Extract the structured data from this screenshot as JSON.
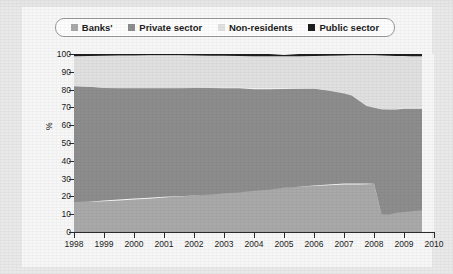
{
  "top_clipped_text": "· · · · · ·",
  "legend": {
    "items": [
      {
        "label": "Banks'",
        "color": "#a9a9a9",
        "icon": "square-swatch-icon"
      },
      {
        "label": "Private sector",
        "color": "#8d8d8d",
        "icon": "square-swatch-icon"
      },
      {
        "label": "Non-residents",
        "color": "#e0e0e0",
        "icon": "square-swatch-icon"
      },
      {
        "label": "Public sector",
        "color": "#1f1f1f",
        "icon": "square-swatch-icon"
      }
    ]
  },
  "axis": {
    "y_label": "%",
    "y_ticks": [
      "100",
      "90",
      "80",
      "70",
      "60",
      "50",
      "40",
      "30",
      "20",
      "10",
      "0"
    ],
    "x_ticks": [
      "1998",
      "1999",
      "2000",
      "2001",
      "2002",
      "2003",
      "2004",
      "2005",
      "2006",
      "2007",
      "2008",
      "2009",
      "2010"
    ]
  },
  "chart_data": {
    "type": "area",
    "stacked": true,
    "stack_total": 100,
    "title": "",
    "subtitle": "",
    "xlabel": "",
    "ylabel": "%",
    "xlim": [
      1998,
      2010
    ],
    "ylim": [
      0,
      100
    ],
    "y_tick_step": 10,
    "grid": false,
    "legend_position": "top",
    "data_end": 2009.6,
    "x": [
      1998.0,
      1998.5,
      1999.0,
      1999.5,
      2000.0,
      2000.5,
      2001.0,
      2001.5,
      2002.0,
      2002.5,
      2003.0,
      2003.5,
      2004.0,
      2004.5,
      2005.0,
      2005.5,
      2006.0,
      2006.5,
      2007.0,
      2007.25,
      2007.5,
      2007.75,
      2008.0,
      2008.25,
      2008.5,
      2008.75,
      2009.0,
      2009.25,
      2009.6
    ],
    "series": [
      {
        "name": "Banks'",
        "color": "#a9a9a9",
        "stack_order": 1,
        "values": [
          17,
          17,
          17.5,
          18,
          18.5,
          19,
          19.5,
          20,
          20.5,
          21,
          22,
          22.5,
          23.5,
          24,
          25,
          25.5,
          26,
          26.5,
          27,
          27,
          27,
          27,
          27,
          10,
          10,
          11,
          11.5,
          12,
          12.5
        ]
      },
      {
        "name": "Private sector",
        "color": "#8d8d8d",
        "stack_order": 2,
        "values": [
          65,
          64.5,
          63.5,
          63,
          62.5,
          62,
          61.5,
          61,
          60.5,
          60,
          59,
          58.5,
          57,
          56.5,
          55.5,
          55,
          54.5,
          53,
          51,
          50,
          47,
          44,
          43,
          59,
          59,
          58,
          58,
          57.5,
          57
        ]
      },
      {
        "name": "Non-residents",
        "color": "#e0e0e0",
        "stack_order": 3,
        "values": [
          17,
          17.5,
          18,
          18,
          18,
          18,
          18,
          18,
          18,
          18,
          18,
          18,
          18.5,
          18.5,
          18.5,
          18.5,
          18.5,
          19.5,
          21,
          22,
          25,
          28,
          29,
          30,
          30,
          30,
          29.5,
          29.5,
          29.5
        ]
      },
      {
        "name": "Public sector",
        "color": "#1f1f1f",
        "stack_order": 4,
        "values": [
          1,
          1,
          1,
          1,
          1,
          1,
          1,
          1,
          1,
          1,
          1,
          1,
          1,
          1,
          0.5,
          1,
          1,
          1,
          1,
          1,
          1,
          1,
          1,
          1,
          1,
          1,
          1,
          1,
          1
        ]
      }
    ]
  }
}
